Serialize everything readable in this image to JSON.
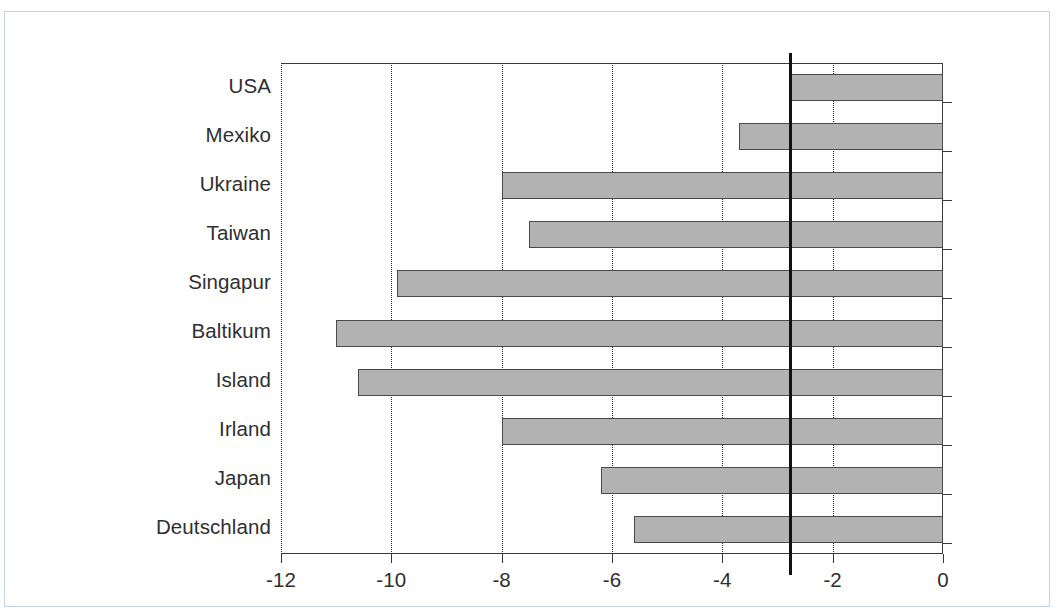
{
  "figure": {
    "caption_cut_off": "",
    "frame_color": "#c3d2e8",
    "bar_fill_color": "#b2b2b2",
    "bar_border_color": "#4a4a4a",
    "axis_color": "#3a3a3a",
    "reference_line_color": "#111111"
  },
  "chart_data": {
    "type": "bar",
    "orientation": "horizontal",
    "title": "",
    "subtitle": "",
    "xlabel": "",
    "ylabel": "",
    "categories": [
      "USA",
      "Mexiko",
      "Ukraine",
      "Taiwan",
      "Singapur",
      "Baltikum",
      "Island",
      "Irland",
      "Japan",
      "Deutschland"
    ],
    "values": [
      -2.8,
      -3.7,
      -8.0,
      -7.5,
      -9.9,
      -11.0,
      -10.6,
      -8.0,
      -6.2,
      -5.6
    ],
    "xlim": [
      -12,
      0
    ],
    "xticks": [
      -12,
      -10,
      -8,
      -6,
      -4,
      -2,
      0
    ],
    "xtick_labels": [
      "-12",
      "-10",
      "-8",
      "-6",
      "-4",
      "-2",
      "0"
    ],
    "grid": "vertical-dotted",
    "legend": "none",
    "annotations": [
      {
        "type": "reference-line",
        "orientation": "vertical",
        "value": -2.8,
        "style": "thick-solid-black"
      }
    ]
  }
}
